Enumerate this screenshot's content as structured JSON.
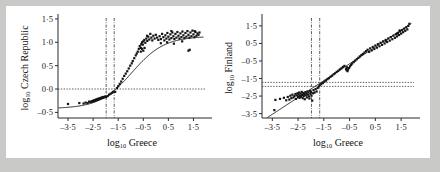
{
  "figure": {
    "background": "#ffffff",
    "page_background": "#c9c9c7",
    "point_color": "#141414",
    "axis_color": "#2b2b2b"
  },
  "chart_data": [
    {
      "type": "scatter",
      "panel": "left",
      "title": "",
      "xlabel": "log10 Greece",
      "xlabel_base": "log",
      "xlabel_sub": "10",
      "xlabel_rest": "Greece",
      "ylabel": "log10 Czech Republic",
      "ylabel_base": "log",
      "ylabel_sub": "10",
      "ylabel_rest": "Czech Republic",
      "xlim": [
        -3.9,
        2.0
      ],
      "ylim": [
        -0.62,
        1.52
      ],
      "xticks": [
        -3.5,
        -2.5,
        -1.5,
        -0.5,
        0.5,
        1.5
      ],
      "xticklabels": [
        "–3·5",
        "–2·5",
        "–1·5",
        "–0·5",
        "0·5",
        "1·5"
      ],
      "yticks": [
        -0.5,
        0.0,
        0.5,
        1.0,
        1.5
      ],
      "yticklabels": [
        "–0·5",
        "0·0",
        "0·5",
        "1·0",
        "1·5"
      ],
      "grid": false,
      "legend": "none",
      "reference_lines": {
        "horizontal": [
          0.0
        ],
        "vertical": [
          -1.98,
          -1.66
        ]
      },
      "fit": {
        "kind": "sigmoid",
        "description": "saturating logistic curve rising from about -0.40 to a plateau near 1.12",
        "lower_asymptote": -0.42,
        "upper_asymptote": 1.13,
        "midpoint_x": -0.95,
        "slope": 1.55
      },
      "points": [
        [
          -3.5,
          -0.32
        ],
        [
          -3.05,
          -0.3
        ],
        [
          -2.88,
          -0.31
        ],
        [
          -2.8,
          -0.29
        ],
        [
          -2.72,
          -0.3
        ],
        [
          -2.66,
          -0.27
        ],
        [
          -2.6,
          -0.28
        ],
        [
          -2.56,
          -0.26
        ],
        [
          -2.52,
          -0.27
        ],
        [
          -2.5,
          -0.25
        ],
        [
          -2.48,
          -0.26
        ],
        [
          -2.45,
          -0.24
        ],
        [
          -2.42,
          -0.25
        ],
        [
          -2.4,
          -0.23
        ],
        [
          -2.38,
          -0.24
        ],
        [
          -2.36,
          -0.22
        ],
        [
          -2.33,
          -0.23
        ],
        [
          -2.31,
          -0.21
        ],
        [
          -2.28,
          -0.22
        ],
        [
          -2.25,
          -0.2
        ],
        [
          -2.22,
          -0.21
        ],
        [
          -2.2,
          -0.19
        ],
        [
          -2.18,
          -0.2
        ],
        [
          -2.15,
          -0.18
        ],
        [
          -2.12,
          -0.19
        ],
        [
          -2.1,
          -0.17
        ],
        [
          -2.06,
          -0.18
        ],
        [
          -2.02,
          -0.16
        ],
        [
          -1.98,
          -0.17
        ],
        [
          -1.92,
          -0.15
        ],
        [
          -1.86,
          -0.12
        ],
        [
          -1.8,
          -0.1
        ],
        [
          -1.74,
          -0.08
        ],
        [
          -1.7,
          -0.06
        ],
        [
          -1.62,
          -0.06
        ],
        [
          -1.55,
          0.02
        ],
        [
          -1.5,
          0.06
        ],
        [
          -1.44,
          0.11
        ],
        [
          -1.38,
          0.16
        ],
        [
          -1.32,
          0.22
        ],
        [
          -1.26,
          0.28
        ],
        [
          -1.2,
          0.33
        ],
        [
          -1.14,
          0.38
        ],
        [
          -1.08,
          0.44
        ],
        [
          -1.02,
          0.5
        ],
        [
          -0.96,
          0.55
        ],
        [
          -0.92,
          0.6
        ],
        [
          -0.86,
          0.66
        ],
        [
          -0.8,
          0.72
        ],
        [
          -0.76,
          0.76
        ],
        [
          -0.72,
          0.8
        ],
        [
          -0.68,
          0.86
        ],
        [
          -0.64,
          0.92
        ],
        [
          -0.6,
          0.88
        ],
        [
          -0.58,
          0.96
        ],
        [
          -0.55,
          1.0
        ],
        [
          -0.52,
          0.95
        ],
        [
          -0.5,
          1.02
        ],
        [
          -0.46,
          1.05
        ],
        [
          -0.42,
          0.99
        ],
        [
          -0.38,
          1.08
        ],
        [
          -0.34,
          1.03
        ],
        [
          -0.3,
          1.12
        ],
        [
          -0.26,
          1.06
        ],
        [
          -0.22,
          1.18
        ],
        [
          -0.18,
          1.1
        ],
        [
          -0.14,
          1.04
        ],
        [
          -0.1,
          1.14
        ],
        [
          -0.05,
          1.08
        ],
        [
          0.0,
          1.16
        ],
        [
          0.05,
          1.1
        ],
        [
          0.1,
          1.05
        ],
        [
          0.15,
          1.13
        ],
        [
          0.2,
          1.07
        ],
        [
          0.25,
          1.18
        ],
        [
          0.3,
          1.11
        ],
        [
          0.34,
          1.04
        ],
        [
          0.38,
          1.15
        ],
        [
          0.42,
          1.08
        ],
        [
          0.46,
          1.2
        ],
        [
          0.5,
          1.12
        ],
        [
          0.54,
          1.06
        ],
        [
          0.58,
          1.17
        ],
        [
          0.62,
          1.09
        ],
        [
          0.66,
          1.21
        ],
        [
          0.7,
          1.13
        ],
        [
          0.74,
          1.07
        ],
        [
          0.78,
          1.18
        ],
        [
          0.82,
          1.1
        ],
        [
          0.86,
          1.22
        ],
        [
          0.9,
          1.14
        ],
        [
          0.94,
          1.08
        ],
        [
          0.98,
          1.19
        ],
        [
          1.02,
          1.11
        ],
        [
          1.06,
          1.23
        ],
        [
          1.1,
          1.15
        ],
        [
          1.14,
          1.09
        ],
        [
          1.18,
          1.2
        ],
        [
          1.22,
          1.12
        ],
        [
          1.26,
          1.24
        ],
        [
          1.3,
          1.16
        ],
        [
          1.34,
          1.1
        ],
        [
          1.38,
          1.21
        ],
        [
          1.42,
          1.13
        ],
        [
          1.46,
          1.25
        ],
        [
          1.5,
          1.17
        ],
        [
          1.54,
          1.11
        ],
        [
          1.58,
          1.22
        ],
        [
          1.62,
          1.14
        ],
        [
          1.66,
          1.19
        ],
        [
          1.7,
          1.16
        ],
        [
          1.74,
          1.21
        ],
        [
          1.3,
          0.82
        ],
        [
          1.35,
          0.84
        ],
        [
          1.05,
          1.02
        ],
        [
          0.72,
          0.97
        ],
        [
          0.45,
          1.0
        ],
        [
          0.2,
          0.98
        ],
        [
          -0.45,
          0.88
        ],
        [
          -0.5,
          0.82
        ],
        [
          -0.55,
          0.86
        ],
        [
          -0.6,
          0.8
        ],
        [
          -0.35,
          1.14
        ],
        [
          0.62,
          1.24
        ],
        [
          1.55,
          1.24
        ]
      ]
    },
    {
      "type": "scatter",
      "panel": "right",
      "title": "",
      "xlabel": "log10 Greece",
      "xlabel_base": "log",
      "xlabel_sub": "10",
      "xlabel_rest": "Greece",
      "ylabel": "log10 Finland",
      "ylabel_base": "log",
      "ylabel_sub": "10",
      "ylabel_rest": "Finland",
      "xlim": [
        -3.9,
        2.0
      ],
      "ylim": [
        -3.75,
        1.95
      ],
      "xticks": [
        -3.5,
        -2.5,
        -1.5,
        -0.5,
        0.5,
        1.5
      ],
      "xticklabels": [
        "–3·5",
        "–2·5",
        "–1·5",
        "–0·5",
        "0·5",
        "1·5"
      ],
      "yticks": [
        -3.5,
        -2.5,
        -1.5,
        -0.5,
        0.5,
        1.5
      ],
      "yticklabels": [
        "–3·5",
        "–2·5",
        "–1·5",
        "–0·5",
        "0·5",
        "1·5"
      ],
      "grid": false,
      "legend": "none",
      "reference_lines": {
        "horizontal": [
          -1.72,
          -1.95
        ],
        "vertical": [
          -1.98,
          -1.66
        ]
      },
      "fit": {
        "kind": "linear",
        "description": "straight regression line through the cloud",
        "slope": 0.96,
        "intercept": -0.18
      },
      "points": [
        [
          -3.42,
          -3.3
        ],
        [
          -3.38,
          -2.72
        ],
        [
          -3.2,
          -2.66
        ],
        [
          -3.05,
          -2.6
        ],
        [
          -2.96,
          -2.74
        ],
        [
          -2.9,
          -2.55
        ],
        [
          -2.84,
          -2.7
        ],
        [
          -2.8,
          -2.48
        ],
        [
          -2.76,
          -2.62
        ],
        [
          -2.72,
          -2.42
        ],
        [
          -2.68,
          -2.58
        ],
        [
          -2.64,
          -2.5
        ],
        [
          -2.6,
          -2.38
        ],
        [
          -2.58,
          -2.66
        ],
        [
          -2.55,
          -2.46
        ],
        [
          -2.52,
          -2.34
        ],
        [
          -2.5,
          -2.56
        ],
        [
          -2.48,
          -2.42
        ],
        [
          -2.46,
          -2.3
        ],
        [
          -2.44,
          -2.6
        ],
        [
          -2.42,
          -2.48
        ],
        [
          -2.4,
          -2.36
        ],
        [
          -2.38,
          -2.54
        ],
        [
          -2.36,
          -2.26
        ],
        [
          -2.34,
          -2.44
        ],
        [
          -2.32,
          -2.62
        ],
        [
          -2.3,
          -2.32
        ],
        [
          -2.28,
          -2.5
        ],
        [
          -2.26,
          -2.4
        ],
        [
          -2.24,
          -2.68
        ],
        [
          -2.22,
          -2.28
        ],
        [
          -2.2,
          -2.46
        ],
        [
          -2.18,
          -2.36
        ],
        [
          -2.16,
          -2.58
        ],
        [
          -2.14,
          -2.24
        ],
        [
          -2.12,
          -2.42
        ],
        [
          -2.1,
          -2.3
        ],
        [
          -2.08,
          -2.52
        ],
        [
          -2.06,
          -2.64
        ],
        [
          -2.04,
          -2.2
        ],
        [
          -2.02,
          -2.38
        ],
        [
          -2.0,
          -2.26
        ],
        [
          -1.98,
          -2.48
        ],
        [
          -1.95,
          -2.76
        ],
        [
          -1.92,
          -2.34
        ],
        [
          -1.9,
          -2.16
        ],
        [
          -1.86,
          -2.3
        ],
        [
          -1.82,
          -2.1
        ],
        [
          -1.78,
          -2.24
        ],
        [
          -1.74,
          -2.04
        ],
        [
          -1.7,
          -1.96
        ],
        [
          -1.66,
          -1.88
        ],
        [
          -1.6,
          -1.82
        ],
        [
          -1.54,
          -1.76
        ],
        [
          -1.48,
          -1.68
        ],
        [
          -1.42,
          -1.62
        ],
        [
          -1.36,
          -1.54
        ],
        [
          -1.3,
          -1.48
        ],
        [
          -1.24,
          -1.4
        ],
        [
          -1.18,
          -1.34
        ],
        [
          -1.12,
          -1.26
        ],
        [
          -1.06,
          -1.2
        ],
        [
          -1.0,
          -1.12
        ],
        [
          -0.94,
          -1.06
        ],
        [
          -0.88,
          -0.98
        ],
        [
          -0.82,
          -0.92
        ],
        [
          -0.76,
          -0.84
        ],
        [
          -0.7,
          -0.78
        ],
        [
          -0.64,
          -0.94
        ],
        [
          -0.6,
          -0.86
        ],
        [
          -0.56,
          -0.98
        ],
        [
          -0.52,
          -0.9
        ],
        [
          -0.48,
          -0.8
        ],
        [
          -0.44,
          -0.72
        ],
        [
          -0.4,
          -0.64
        ],
        [
          -0.34,
          -0.56
        ],
        [
          -0.28,
          -0.48
        ],
        [
          -0.22,
          -0.4
        ],
        [
          -0.16,
          -0.32
        ],
        [
          -0.1,
          -0.24
        ],
        [
          -0.04,
          -0.16
        ],
        [
          0.02,
          -0.1
        ],
        [
          0.08,
          -0.02
        ],
        [
          0.14,
          0.06
        ],
        [
          0.2,
          0.14
        ],
        [
          0.26,
          0.02
        ],
        [
          0.3,
          0.22
        ],
        [
          0.36,
          0.1
        ],
        [
          0.4,
          0.3
        ],
        [
          0.46,
          0.18
        ],
        [
          0.5,
          0.38
        ],
        [
          0.56,
          0.26
        ],
        [
          0.6,
          0.46
        ],
        [
          0.66,
          0.34
        ],
        [
          0.7,
          0.54
        ],
        [
          0.76,
          0.42
        ],
        [
          0.8,
          0.62
        ],
        [
          0.86,
          0.5
        ],
        [
          0.9,
          0.7
        ],
        [
          0.96,
          0.58
        ],
        [
          1.0,
          0.78
        ],
        [
          1.06,
          0.66
        ],
        [
          1.1,
          0.86
        ],
        [
          1.16,
          0.74
        ],
        [
          1.2,
          0.94
        ],
        [
          1.26,
          0.82
        ],
        [
          1.3,
          1.02
        ],
        [
          1.34,
          0.9
        ],
        [
          1.38,
          1.1
        ],
        [
          1.42,
          0.98
        ],
        [
          1.46,
          1.18
        ],
        [
          1.5,
          1.06
        ],
        [
          1.54,
          1.26
        ],
        [
          1.58,
          1.14
        ],
        [
          1.62,
          1.34
        ],
        [
          1.66,
          1.22
        ],
        [
          1.7,
          1.42
        ],
        [
          1.74,
          1.3
        ],
        [
          1.78,
          1.5
        ],
        [
          1.82,
          1.62
        ],
        [
          -0.62,
          -1.02
        ],
        [
          -0.58,
          -1.08
        ],
        [
          0.92,
          0.64
        ],
        [
          1.34,
          1.06
        ],
        [
          1.44,
          1.24
        ]
      ]
    }
  ]
}
